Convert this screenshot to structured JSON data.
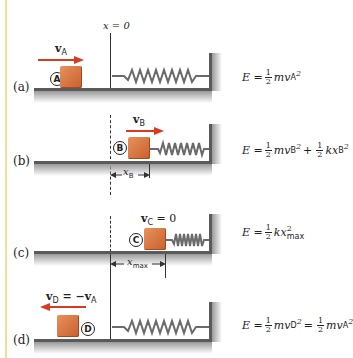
{
  "origin_label": "x = 0",
  "colors": {
    "block": "#d9733f",
    "arrow": "#d93a22",
    "floor": "#5a5a5a",
    "spring": "#6a6a6a",
    "left_bar": "#f2dc9a"
  },
  "panels": [
    {
      "label": "(a)",
      "state": "A",
      "velocity_label": "v",
      "velocity_sub": "A",
      "velocity_suffix": "",
      "arrow_direction": "right",
      "energy": {
        "lhs": "E =",
        "half1": [
          "1",
          "2"
        ],
        "term1": "mv",
        "term1_sub": "A",
        "term1_sup": "2"
      }
    },
    {
      "label": "(b)",
      "state": "B",
      "velocity_label": "v",
      "velocity_sub": "B",
      "velocity_suffix": "",
      "arrow_direction": "right",
      "dimension_label": "x",
      "dimension_sub": "B",
      "energy": {
        "lhs": "E =",
        "half1": [
          "1",
          "2"
        ],
        "term1": "mv",
        "term1_sub": "B",
        "term1_sup": "2",
        "op": "+",
        "half2": [
          "1",
          "2"
        ],
        "term2": "kx",
        "term2_sub": "B",
        "term2_sup": "2"
      }
    },
    {
      "label": "(c)",
      "state": "C",
      "velocity_label": "v",
      "velocity_sub": "C",
      "velocity_suffix": " = 0",
      "dimension_label": "x",
      "dimension_sub": "max",
      "energy": {
        "lhs": "E =",
        "half1": [
          "1",
          "2"
        ],
        "term1": "kx",
        "term1_sub": "max",
        "term1_sup": "2"
      }
    },
    {
      "label": "(d)",
      "state": "D",
      "velocity_label": "v",
      "velocity_sub": "D",
      "velocity_suffix": " = −v",
      "velocity_suffix_sub": "A",
      "arrow_direction": "left",
      "energy": {
        "lhs": "E =",
        "half1": [
          "1",
          "2"
        ],
        "term1": "mv",
        "term1_sub": "D",
        "term1_sup": "2",
        "op": "=",
        "half2": [
          "1",
          "2"
        ],
        "term2": "mv",
        "term2_sub": "A",
        "term2_sup": "2"
      }
    }
  ]
}
